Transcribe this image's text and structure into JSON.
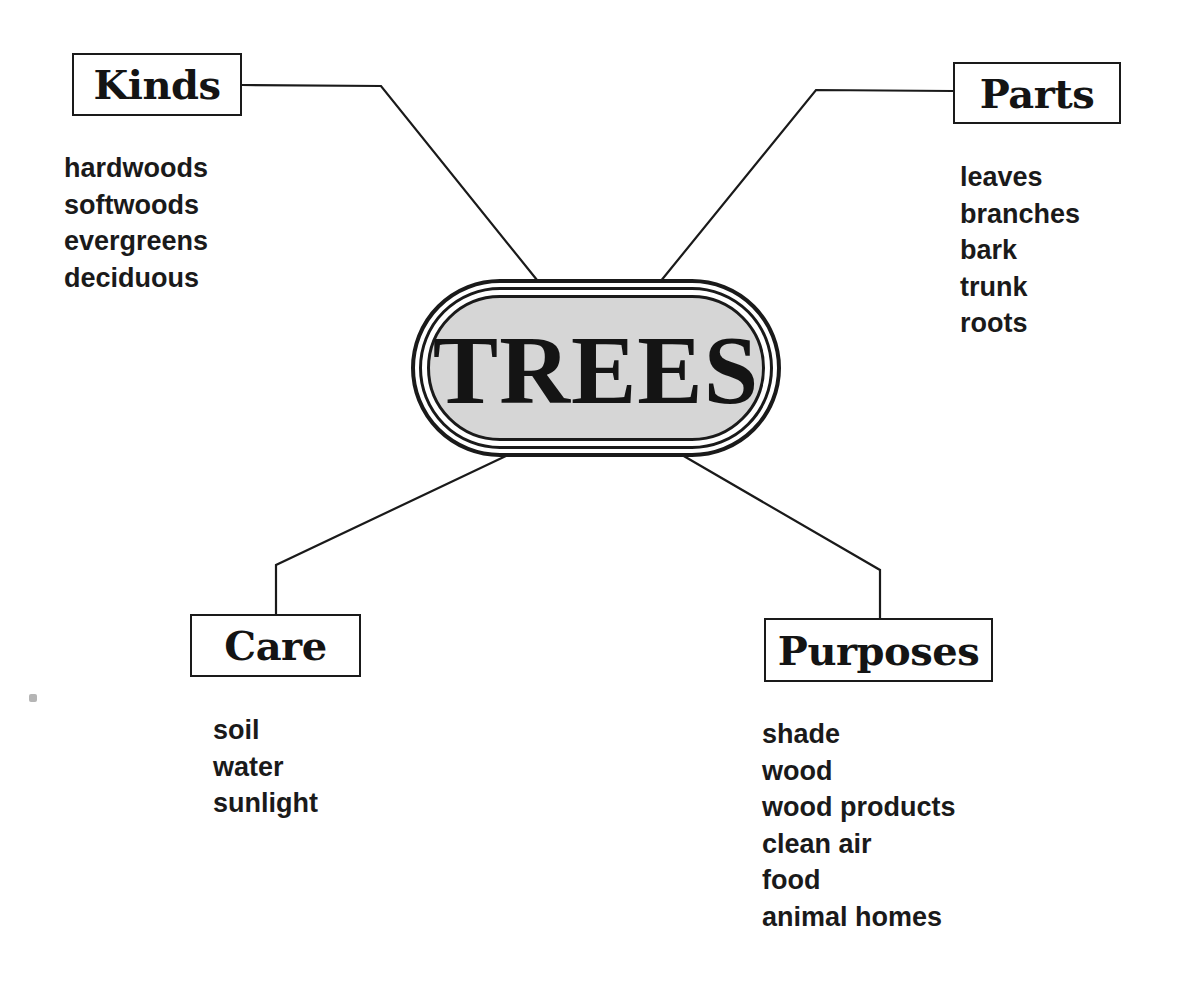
{
  "center": {
    "title": "TREES",
    "fill_color": "#d6d6d6"
  },
  "branches": [
    {
      "id": "kinds",
      "label": "Kinds",
      "items": [
        "hardwoods",
        "softwoods",
        "evergreens",
        "deciduous"
      ]
    },
    {
      "id": "parts",
      "label": "Parts",
      "items": [
        "leaves",
        "branches",
        "bark",
        "trunk",
        "roots"
      ]
    },
    {
      "id": "care",
      "label": "Care",
      "items": [
        "soil",
        "water",
        "sunlight"
      ]
    },
    {
      "id": "purposes",
      "label": "Purposes",
      "items": [
        "shade",
        "wood",
        "wood products",
        "clean air",
        "food",
        "animal homes"
      ]
    }
  ],
  "colors": {
    "line": "#1a1a1a",
    "text": "#141414",
    "background": "#ffffff"
  }
}
